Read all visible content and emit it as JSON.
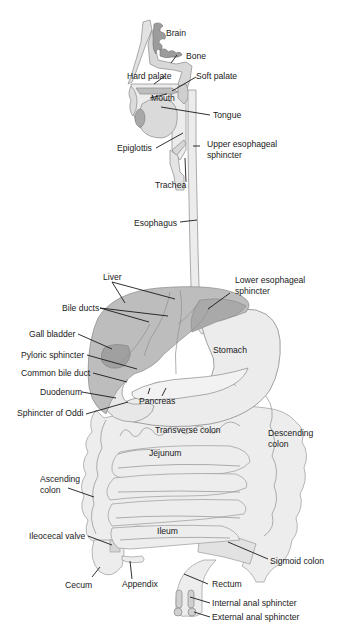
{
  "diagram": {
    "colors": {
      "background": "#ffffff",
      "tissue_light": "#ededed",
      "liver": "#bdbdbd",
      "liver_dark": "#a9a9a9",
      "gall_bladder": "#a0a0a0",
      "brain": "#9c9c9c",
      "outline": "#8a8a8a",
      "text": "#1a1a1a"
    },
    "labels": {
      "brain": "Brain",
      "bone": "Bone",
      "hard_palate": "Hard palate",
      "soft_palate": "Soft palate",
      "mouth": "Mouth",
      "tongue": "Tongue",
      "epiglottis": "Epiglottis",
      "upper_esophageal_sphincter_1": "Upper esophageal",
      "upper_esophageal_sphincter_2": "sphincter",
      "trachea": "Trachea",
      "esophagus": "Esophagus",
      "liver": "Liver",
      "lower_esophageal_sphincter_1": "Lower esophageal",
      "lower_esophageal_sphincter_2": "sphincter",
      "bile_ducts": "Bile ducts",
      "gall_bladder": "Gall bladder",
      "stomach": "Stomach",
      "pyloric_sphincter": "Pyloric sphincter",
      "common_bile_duct": "Common bile duct",
      "duodenum": "Duodenum",
      "pancreas": "Pancreas",
      "sphincter_of_oddi": "Sphincter of Oddi",
      "transverse_colon": "Transverse colon",
      "descending_colon_1": "Descending",
      "descending_colon_2": "colon",
      "jejunum": "Jejunum",
      "ascending_colon_1": "Ascending",
      "ascending_colon_2": "colon",
      "ileocecal_valve": "Ileocecal valve",
      "ileum": "Ileum",
      "sigmoid_colon": "Sigmoid colon",
      "cecum": "Cecum",
      "appendix": "Appendix",
      "rectum": "Rectum",
      "internal_anal_sphincter": "Internal anal sphincter",
      "external_anal_sphincter": "External anal sphincter"
    }
  }
}
